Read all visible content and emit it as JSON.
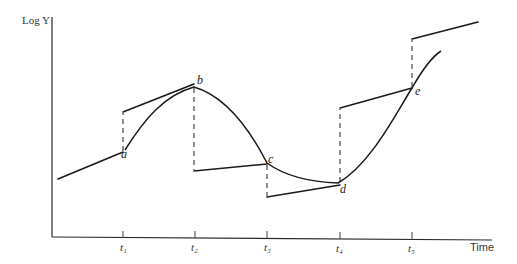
{
  "diagram": {
    "y_axis_label": "Log Y",
    "x_axis_label": "Time",
    "time_ticks": [
      "t₁",
      "t₂",
      "t₃",
      "t₄",
      "t₅"
    ],
    "points": {
      "a": "a",
      "b": "b",
      "c": "c",
      "d": "d",
      "e": "e"
    },
    "colors": {
      "line": "#1a1a1a",
      "background": "#ffffff"
    }
  }
}
